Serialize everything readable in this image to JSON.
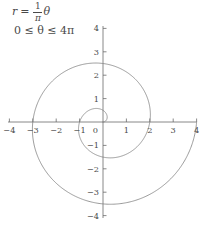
{
  "figure": {
    "title": "",
    "equation_r": {
      "lhs": "r",
      "eq": "=",
      "num": "1",
      "den": "π",
      "theta": "θ"
    },
    "equation_domain": "0 ≤ θ ≤ 4π",
    "axis_color": "#6b6b6b",
    "curve_color": "#7a7a7a",
    "label_color": "#4a4a4a",
    "background": "#ffffff"
  },
  "chart_data": {
    "type": "line",
    "plot_kind": "polar-spiral",
    "title": "",
    "xlabel": "",
    "ylabel": "",
    "equation": "r = (1/π)θ",
    "theta_min": 0,
    "theta_max": 12.566370614359172,
    "theta_max_label": "4π",
    "r_at_theta_max": 4,
    "xlim": [
      -4,
      4
    ],
    "ylim": [
      -4,
      4
    ],
    "grid": false,
    "legend": null,
    "x_ticks": [
      -4,
      -3,
      -2,
      -1,
      0,
      1,
      2,
      3,
      4
    ],
    "x_tick_labels": [
      "−4",
      "−3",
      "−2",
      "−1",
      "0",
      "1",
      "2",
      "3",
      "4"
    ],
    "y_ticks": [
      -4,
      -3,
      -2,
      -1,
      1,
      2,
      3,
      4
    ],
    "y_tick_labels": [
      "−4",
      "−3",
      "−2",
      "−1",
      "1",
      "2",
      "3",
      "4"
    ],
    "origin_label": "0",
    "annotations": [
      {
        "text": "r = (1/π)θ",
        "x": -3.6,
        "y": 3.9
      },
      {
        "text": "0 ≤ θ ≤ 4π",
        "x": -3.6,
        "y": 3.1
      }
    ],
    "key_points": [
      {
        "theta": 0,
        "r": 0,
        "x": 0,
        "y": 0
      },
      {
        "theta": 1.5707963,
        "r": 0.5,
        "x": 0,
        "y": 0.5
      },
      {
        "theta": 3.1415927,
        "r": 1,
        "x": -1,
        "y": 0
      },
      {
        "theta": 4.712389,
        "r": 1.5,
        "x": 0,
        "y": -1.5
      },
      {
        "theta": 6.2831853,
        "r": 2,
        "x": 2,
        "y": 0
      },
      {
        "theta": 7.8539816,
        "r": 2.5,
        "x": 0,
        "y": 2.5
      },
      {
        "theta": 9.424778,
        "r": 3,
        "x": -3,
        "y": 0
      },
      {
        "theta": 10.9955743,
        "r": 3.5,
        "x": 0,
        "y": -3.5
      },
      {
        "theta": 12.5663706,
        "r": 4,
        "x": 4,
        "y": 0
      }
    ]
  },
  "geometry": {
    "origin_x": 103,
    "origin_y": 122,
    "unit_px": 23.4,
    "x_axis_left_px": 8,
    "x_axis_right_px": 196,
    "y_axis_top_px": 26,
    "y_axis_bottom_px": 218,
    "tick_len": 3.5
  }
}
